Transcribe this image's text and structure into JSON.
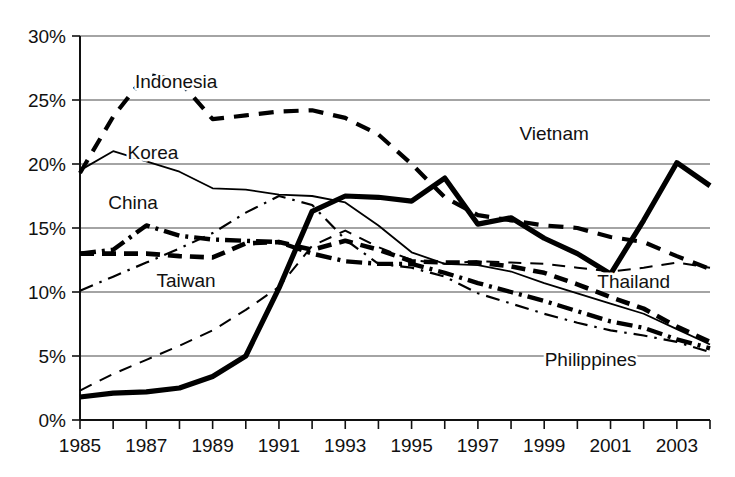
{
  "chart_data": {
    "type": "line",
    "title": "",
    "subtitle": "",
    "xlabel": "",
    "ylabel": "",
    "x": [
      1985,
      1986,
      1987,
      1988,
      1989,
      1990,
      1991,
      1992,
      1993,
      1994,
      1995,
      1996,
      1997,
      1998,
      1999,
      2000,
      2001,
      2002,
      2003,
      2004
    ],
    "xlim": [
      1985,
      2004
    ],
    "ylim": [
      0,
      30
    ],
    "y_ticks": [
      0,
      5,
      10,
      15,
      20,
      25,
      30
    ],
    "y_tick_labels": [
      "0%",
      "5%",
      "10%",
      "15%",
      "20%",
      "25%",
      "30%"
    ],
    "x_tick_labels": [
      "1985",
      "1987",
      "1989",
      "1991",
      "1993",
      "1995",
      "1997",
      "1999",
      "2001",
      "2003"
    ],
    "x_tick_values": [
      1985,
      1987,
      1989,
      1991,
      1993,
      1995,
      1997,
      1999,
      2001,
      2003
    ],
    "grid": true,
    "grid_axis": "y",
    "legend_position": "inline-labels",
    "units": "percent",
    "series": [
      {
        "name": "Indonesia",
        "style": "dashed-thick",
        "label_x": 1987.9,
        "label_y": 25.9,
        "values": [
          19.3,
          23.7,
          27.0,
          26.5,
          23.5,
          23.8,
          24.1,
          24.2,
          23.6,
          22.3,
          20.0,
          17.4,
          16.0,
          15.6,
          15.2,
          15.0,
          14.3,
          13.9,
          12.8,
          11.8
        ]
      },
      {
        "name": "Korea",
        "style": "thin-solid",
        "label_x": 1987.2,
        "label_y": 20.4,
        "values": [
          19.5,
          21.0,
          20.2,
          19.4,
          18.1,
          18.0,
          17.6,
          17.5,
          17.0,
          15.2,
          13.1,
          12.2,
          12.1,
          11.6,
          10.7,
          9.9,
          9.1,
          8.3,
          7.1,
          5.9
        ]
      },
      {
        "name": "China",
        "style": "thick-dashdot",
        "label_x": 1986.6,
        "label_y": 16.5,
        "values": [
          13.0,
          13.3,
          15.2,
          14.4,
          14.1,
          14.0,
          13.9,
          13.0,
          12.4,
          12.2,
          12.2,
          11.5,
          10.7,
          10.0,
          9.3,
          8.5,
          7.7,
          7.2,
          6.3,
          5.6
        ]
      },
      {
        "name": "Taiwan",
        "style": "thin-dashed",
        "label_x": 1988.2,
        "label_y": 10.4,
        "values": [
          2.3,
          3.6,
          4.7,
          5.8,
          7.0,
          8.6,
          10.4,
          13.6,
          14.8,
          13.5,
          12.5,
          12.2,
          12.4,
          12.3,
          12.2,
          11.9,
          11.6,
          11.9,
          12.3,
          11.9
        ]
      },
      {
        "name": "Vietnam",
        "style": "thick-solid",
        "label_x": 1999.3,
        "label_y": 21.9,
        "values": [
          1.8,
          2.1,
          2.2,
          2.5,
          3.4,
          5.0,
          10.3,
          16.3,
          17.5,
          17.4,
          17.1,
          18.9,
          15.3,
          15.8,
          14.2,
          13.0,
          11.4,
          15.6,
          20.1,
          18.3
        ]
      },
      {
        "name": "Thailand",
        "style": "thick-dashed",
        "label_x": 2001.7,
        "label_y": 10.3,
        "values": [
          13.0,
          13.0,
          13.0,
          12.8,
          12.7,
          13.8,
          13.9,
          13.3,
          14.0,
          13.3,
          12.4,
          12.3,
          12.3,
          12.0,
          11.5,
          10.6,
          9.6,
          8.7,
          7.3,
          6.1
        ]
      },
      {
        "name": "Philippines",
        "style": "thin-dashdot",
        "label_x": 2000.4,
        "label_y": 4.2,
        "values": [
          10.1,
          11.2,
          12.3,
          13.4,
          14.6,
          16.2,
          17.5,
          16.8,
          14.1,
          12.2,
          11.9,
          11.2,
          9.9,
          9.1,
          8.3,
          7.6,
          7.0,
          6.6,
          6.1,
          5.3
        ]
      }
    ]
  },
  "axes": {
    "y_axis_name": "percentage-axis",
    "x_axis_name": "year-axis"
  }
}
